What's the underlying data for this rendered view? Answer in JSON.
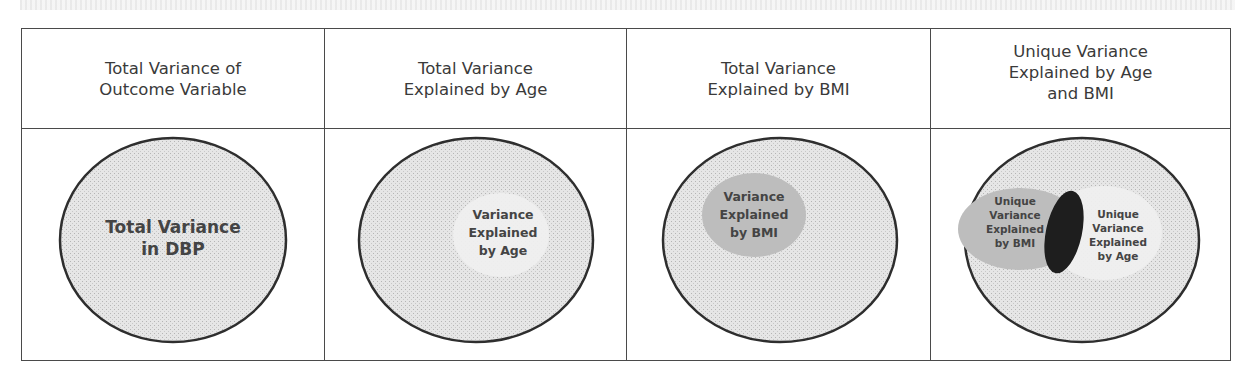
{
  "headers": [
    {
      "label": "Total Variance of\nOutcome Variable"
    },
    {
      "label": "Total Variance\nExplained by Age"
    },
    {
      "label": "Total Variance\nExplained by BMI"
    },
    {
      "label": "Unique Variance\nExplained by Age\nand BMI"
    }
  ],
  "cells": [
    {
      "lines": [
        "Total Variance",
        "in DBP"
      ]
    },
    {
      "lines": [
        "Variance",
        "Explained",
        "by Age"
      ]
    },
    {
      "lines": [
        "Variance",
        "Explained",
        "by BMI"
      ]
    },
    {
      "left_lines": [
        "Unique",
        "Variance",
        "Explained",
        "by BMI"
      ],
      "right_lines": [
        "Unique",
        "Variance",
        "Explained",
        "by Age"
      ]
    }
  ],
  "colors": {
    "border": "#4a4a4a",
    "ellipse_fill": "#d9d9d9",
    "age_region": "#efefef",
    "bmi_region": "#bdbdbd",
    "overlap": "#1e1e1e"
  }
}
